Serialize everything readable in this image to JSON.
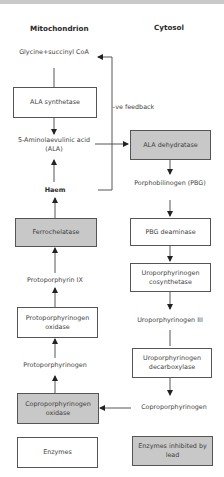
{
  "headers": {
    "mitochondrion": "Mitochondrion",
    "cytosol": "Cytosol"
  },
  "mitochondrion": {
    "glycine": "Glycine+succinyl CoA",
    "ala_synthetase": "ALA synthetase",
    "ala": "5-Aminolaevulinic acid (ALA)",
    "haem": "Haem",
    "ferrochelatase": "Ferrochelatase",
    "protoporphyrin_ix": "Protoporphyrin IX",
    "protoporphyrinogen_oxidase": "Protoporphyrinogen oxidase",
    "protoporphyrinogen": "Protoporphyrinogen",
    "coproporphyrinogen_oxidase": "Coproporphyrinogen oxidase"
  },
  "cytosol": {
    "ala_dehydratase": "ALA dehydratase",
    "pbg": "Porphobilinogen (PBG)",
    "pbg_deaminase": "PBG deaminase",
    "uro_cosynthetase": "Uroporphyrinogen cosynthetase",
    "uro_iii": "Uroporphyrinogen III",
    "uro_decarboxylase": "Uroporphyrinogen decarboxylase",
    "coproporphyrinogen": "Coproporphyrinogen"
  },
  "feedback_label": "–ve feedback",
  "legend": {
    "enzymes": "Enzymes",
    "inhibited": "Enzymes inhibited by lead"
  },
  "colors": {
    "inhibited_fill": "#c8c8c8",
    "normal_fill": "#ffffff",
    "line": "#333333"
  }
}
